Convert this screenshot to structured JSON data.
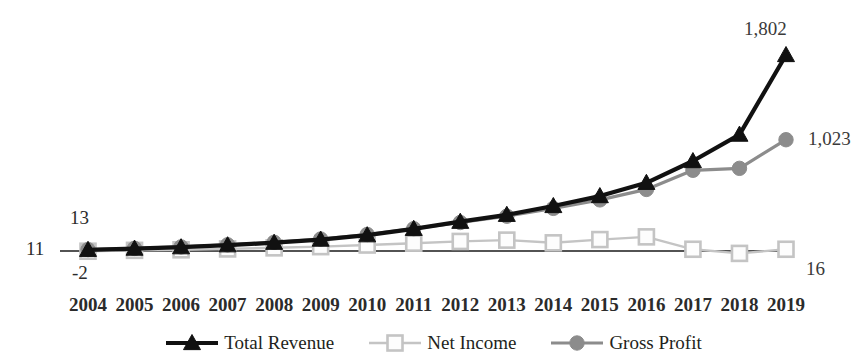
{
  "chart_data": {
    "type": "line",
    "title": "",
    "subtitle": "",
    "xlabel": "",
    "ylabel": "",
    "grid": false,
    "legend_position": "bottom",
    "categories": [
      "2004",
      "2005",
      "2006",
      "2007",
      "2008",
      "2009",
      "2010",
      "2011",
      "2012",
      "2013",
      "2014",
      "2015",
      "2016",
      "2017",
      "2018",
      "2019"
    ],
    "ylim": [
      -60,
      1900
    ],
    "series": [
      {
        "name": "Total Revenue",
        "color": "#111111",
        "marker": "triangle",
        "values": [
          11,
          22,
          35,
          53,
          76,
          105,
          145,
          204,
          269,
          333,
          414,
          505,
          627,
          827,
          1070,
          1802
        ]
      },
      {
        "name": "Net Income",
        "color": "#c4c4c4",
        "marker": "square",
        "values": [
          -2,
          6,
          11,
          19,
          29,
          40,
          55,
          72,
          88,
          100,
          75,
          105,
          130,
          16,
          -22,
          16
        ]
      },
      {
        "name": "Gross Profit",
        "color": "#8c8c8c",
        "marker": "circle",
        "values": [
          13,
          24,
          38,
          57,
          80,
          110,
          152,
          205,
          262,
          320,
          392,
          470,
          566,
          742,
          760,
          1023
        ]
      }
    ],
    "point_labels": [
      {
        "id": "revenue-start",
        "text": "11",
        "series": "Total Revenue",
        "category": "2004"
      },
      {
        "id": "grossprofit-start",
        "text": "13",
        "series": "Gross Profit",
        "category": "2004"
      },
      {
        "id": "netincome-start",
        "text": "-2",
        "series": "Net Income",
        "category": "2004"
      },
      {
        "id": "revenue-end",
        "text": "1,802",
        "series": "Total Revenue",
        "category": "2019"
      },
      {
        "id": "grossprofit-end",
        "text": "1,023",
        "series": "Gross Profit",
        "category": "2019"
      },
      {
        "id": "netincome-end",
        "text": "16",
        "series": "Net Income",
        "category": "2019"
      }
    ]
  },
  "legend": {
    "items": [
      {
        "label": "Total Revenue",
        "marker": "triangle-icon",
        "color": "#111111"
      },
      {
        "label": "Net Income",
        "marker": "square-icon",
        "color": "#c4c4c4"
      },
      {
        "label": "Gross Profit",
        "marker": "circle-icon",
        "color": "#8c8c8c"
      }
    ]
  },
  "labels": {
    "left_revenue": "11",
    "left_gross": "13",
    "left_net": "-2",
    "right_revenue": "1,802",
    "right_gross": "1,023",
    "right_net": "16"
  },
  "colors": {
    "revenue": "#111111",
    "net_income": "#c4c4c4",
    "gross_profit": "#8c8c8c",
    "axis": "#1a1a1a",
    "text": "#2b2b2b",
    "background": "#ffffff"
  }
}
